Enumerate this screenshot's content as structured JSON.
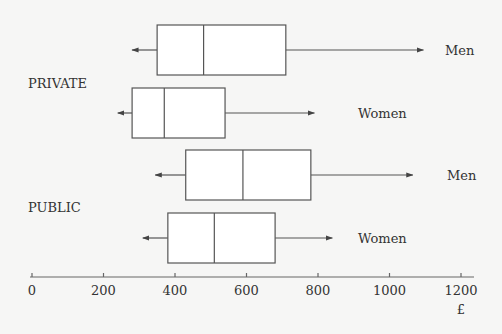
{
  "chart_data": {
    "type": "boxplot",
    "title": "",
    "xlabel": "£",
    "ylabel": "",
    "xlim": [
      0,
      1200
    ],
    "xticks": [
      0,
      200,
      400,
      600,
      800,
      1000,
      1200
    ],
    "xtick_labels": [
      "0",
      "200",
      "400",
      "600",
      "800",
      "1000",
      "1200"
    ],
    "grid": false,
    "whisker_style": "arrows (open-ended)",
    "groups": [
      {
        "name": "PRIVATE",
        "series": [
          {
            "name": "Men",
            "min": 280,
            "q1": 350,
            "median": 480,
            "q3": 710,
            "max": 1095
          },
          {
            "name": "Women",
            "min": 240,
            "q1": 280,
            "median": 370,
            "q3": 540,
            "max": 790
          }
        ]
      },
      {
        "name": "PUBLIC",
        "series": [
          {
            "name": "Men",
            "min": 345,
            "q1": 430,
            "median": 590,
            "q3": 780,
            "max": 1065
          },
          {
            "name": "Women",
            "min": 310,
            "q1": 380,
            "median": 510,
            "q3": 680,
            "max": 840
          }
        ]
      }
    ]
  }
}
